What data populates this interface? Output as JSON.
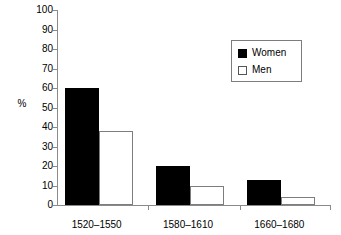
{
  "chart_data": {
    "type": "bar",
    "title": "",
    "subtitle": "",
    "xlabel": "",
    "ylabel": "%",
    "ylim": [
      0,
      100
    ],
    "ytick_step": 10,
    "yticks": [
      0,
      10,
      20,
      30,
      40,
      50,
      60,
      70,
      80,
      90,
      100
    ],
    "grid": false,
    "legend_position": "top-right",
    "categories": [
      "1520–1550",
      "1580–1610",
      "1660–1680"
    ],
    "series": [
      {
        "name": "Women",
        "color": "#000000",
        "fill": "solid",
        "values": [
          60,
          20,
          13
        ]
      },
      {
        "name": "Men",
        "color": "#ffffff",
        "fill": "hollow",
        "values": [
          38,
          10,
          4
        ]
      }
    ],
    "annotations": []
  },
  "legend": {
    "items": [
      {
        "label": "Women",
        "swatch": "filled-square-icon"
      },
      {
        "label": "Men",
        "swatch": "hollow-square-icon"
      }
    ]
  },
  "caption": {
    "clipped_text": "partially visible cut-off caption line"
  }
}
